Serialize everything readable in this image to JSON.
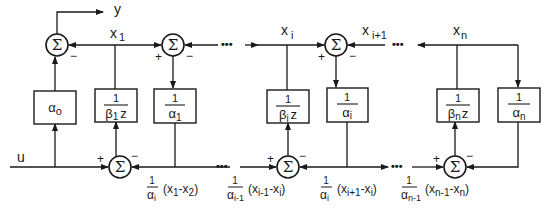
{
  "diagram": {
    "type": "block-diagram",
    "signals": {
      "input": "u",
      "output": "y",
      "states": [
        "x",
        "x",
        "x",
        "x"
      ],
      "state_subs": [
        "1",
        "i",
        "i+1",
        "n"
      ]
    },
    "sum_symbol": "Σ",
    "signs": {
      "plus": "+",
      "minus": "−"
    },
    "ellipsis": "•••",
    "blocks": [
      {
        "id": "alpha0",
        "kind": "gain",
        "main": "α",
        "sub": "o"
      },
      {
        "id": "beta1z",
        "kind": "fraction",
        "num": "1",
        "den_main": "β",
        "den_sub": "1",
        "den_tail": "z"
      },
      {
        "id": "alpha1",
        "kind": "fraction",
        "num": "1",
        "den_main": "α",
        "den_sub": "1"
      },
      {
        "id": "betaiz",
        "kind": "fraction",
        "num": "1",
        "den_main": "β",
        "den_sub": "i",
        "den_tail": "z"
      },
      {
        "id": "alphai",
        "kind": "fraction",
        "num": "1",
        "den_main": "α",
        "den_sub": "i"
      },
      {
        "id": "betanz",
        "kind": "fraction",
        "num": "1",
        "den_main": "β",
        "den_sub": "n",
        "den_tail": "z"
      },
      {
        "id": "alphan",
        "kind": "fraction",
        "num": "1",
        "den_main": "α",
        "den_sub": "n"
      }
    ],
    "bottom_labels": [
      {
        "num": "1",
        "den_main": "α",
        "den_sub": "i",
        "expr_open": "(x",
        "a_sub": "1",
        "mid": "-x",
        "b_sub": "2",
        "close": ")"
      },
      {
        "num": "1",
        "den_main": "α",
        "den_sub": "i-1",
        "expr_open": "(x",
        "a_sub": "i-1",
        "mid": "-x",
        "b_sub": "i",
        "close": ")"
      },
      {
        "num": "1",
        "den_main": "α",
        "den_sub": "i",
        "expr_open": "(x",
        "a_sub": "i+1",
        "mid": "-x",
        "b_sub": "i",
        "close": ")"
      },
      {
        "num": "1",
        "den_main": "α",
        "den_sub": "n-1",
        "expr_open": "(x",
        "a_sub": "n-1",
        "mid": "-x",
        "b_sub": "n",
        "close": ")"
      }
    ]
  }
}
